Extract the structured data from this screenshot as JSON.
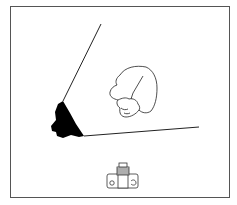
{
  "illustration": {
    "description": "Line drawing: hand pressing down on a flat sheet with a black rounded corner; camera icon below",
    "colors": {
      "background": "#ffffff",
      "line": "#222222",
      "fill_dark": "#000000",
      "frame": "#555555"
    },
    "elements": {
      "sheet": "sheet-outline",
      "sheet_corner": "black-corner-tab",
      "hand": "hand-pressing-icon",
      "camera": "camera-icon"
    }
  }
}
